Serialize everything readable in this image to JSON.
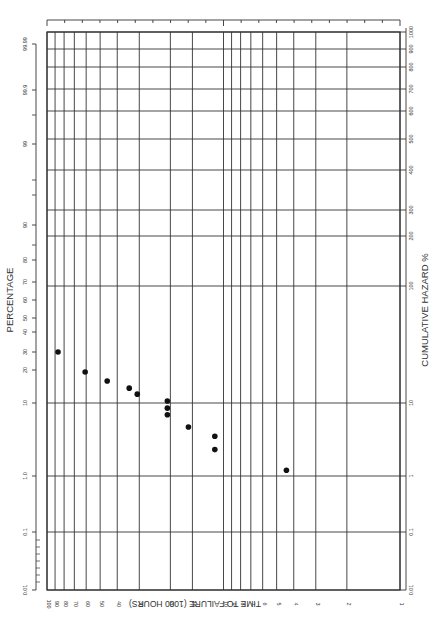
{
  "chart_data": {
    "type": "scatter",
    "title": "",
    "orientation": "rotated-90",
    "xlabel": "TIME TO FAILURE (1000 HOURS)",
    "ylabel": "CUMULATIVE HAZARD %",
    "secondary_ylabel": "PERCENTAGE",
    "x_scale": "log",
    "y_scale": "log",
    "xlim": [
      1,
      100
    ],
    "ylim": [
      0.01,
      1000
    ],
    "x_ticks": [
      "100",
      "90",
      "80",
      "70",
      "60",
      "50",
      "40",
      "30",
      "20",
      "15",
      "10",
      "9",
      "8",
      "7",
      "6",
      "5",
      "4",
      "3",
      "2",
      "1"
    ],
    "y_ticks": [
      "0.01",
      "0.1",
      "1",
      "10",
      "100",
      "200",
      "300",
      "400",
      "500",
      "600",
      "700",
      "800",
      "900",
      "1000"
    ],
    "percentage_ticks": [
      "0.01",
      "0.1",
      "1.0",
      "10",
      "20",
      "30",
      "40",
      "50",
      "60",
      "70",
      "80",
      "90",
      "99",
      "99.9",
      "99.99"
    ],
    "grid": true,
    "legend": null,
    "series": [
      {
        "name": "failures",
        "points": [
          {
            "x": 86.6,
            "y": 27.3
          },
          {
            "x": 60.8,
            "y": 18.4
          },
          {
            "x": 45.6,
            "y": 15.4
          },
          {
            "x": 34.2,
            "y": 13.4
          },
          {
            "x": 30.8,
            "y": 11.9
          },
          {
            "x": 20.8,
            "y": 10.4
          },
          {
            "x": 20.8,
            "y": 8.5
          },
          {
            "x": 20.8,
            "y": 6.9
          },
          {
            "x": 15.8,
            "y": 4.7
          },
          {
            "x": 11.2,
            "y": 3.5
          },
          {
            "x": 11.2,
            "y": 2.3
          },
          {
            "x": 4.4,
            "y": 1.2
          }
        ]
      }
    ]
  },
  "labels": {
    "xlabel": "TIME TO FAILURE (1000 HOURS)",
    "ylabel": "CUMULATIVE HAZARD %",
    "percentage": "PERCENTAGE"
  },
  "colors": {
    "grid": "#333333",
    "point": "#111111",
    "background": "#ffffff"
  }
}
